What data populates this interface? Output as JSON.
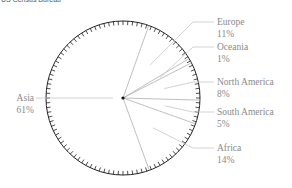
{
  "source": "US Census Bureau",
  "colors": {
    "outline": "#222222",
    "boundary": "#b0b0b0",
    "leader": "#c8c8c8",
    "label": "#8a8a8a",
    "center_dot": "#111111"
  },
  "chart_data": {
    "type": "pie",
    "title": "",
    "start_angle_deg": 160,
    "direction": "clockwise",
    "slices": [
      {
        "label": "Asia",
        "value": 61,
        "value_label": "61%",
        "label_side": "left"
      },
      {
        "label": "Europe",
        "value": 11,
        "value_label": "11%",
        "label_side": "right"
      },
      {
        "label": "Oceania",
        "value": 1,
        "value_label": "1%",
        "label_side": "right"
      },
      {
        "label": "North America",
        "value": 8,
        "value_label": "8%",
        "label_side": "right"
      },
      {
        "label": "South America",
        "value": 5,
        "value_label": "5%",
        "label_side": "right"
      },
      {
        "label": "Africa",
        "value": 14,
        "value_label": "14%",
        "label_side": "right"
      }
    ],
    "tick_marks": 100,
    "fill": "none",
    "legend": "none"
  }
}
